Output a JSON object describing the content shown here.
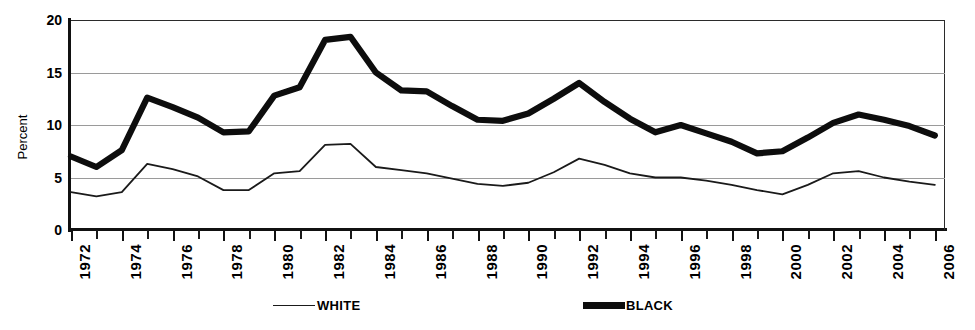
{
  "chart_data": {
    "type": "line",
    "title": "",
    "xlabel": "",
    "ylabel": "Percent",
    "ylim": [
      0,
      20
    ],
    "yticks": [
      0,
      5,
      10,
      15,
      20
    ],
    "xlim": [
      1972,
      2006
    ],
    "grid": true,
    "legend_position": "bottom",
    "x": [
      1972,
      1973,
      1974,
      1975,
      1976,
      1977,
      1978,
      1979,
      1980,
      1981,
      1982,
      1983,
      1984,
      1985,
      1986,
      1987,
      1988,
      1989,
      1990,
      1991,
      1992,
      1993,
      1994,
      1995,
      1996,
      1997,
      1998,
      1999,
      2000,
      2001,
      2002,
      2003,
      2004,
      2005,
      2006
    ],
    "xtick_labels": [
      "1972",
      "1974",
      "1976",
      "1978",
      "1980",
      "1982",
      "1984",
      "1986",
      "1988",
      "1990",
      "1992",
      "1994",
      "1996",
      "1998",
      "2000",
      "2002",
      "2004",
      "2006"
    ],
    "series": [
      {
        "name": "WHITE",
        "style": "thin",
        "color": "#1a1a1a",
        "values": [
          3.6,
          3.2,
          3.6,
          6.3,
          5.8,
          5.1,
          3.8,
          3.8,
          5.4,
          5.6,
          8.1,
          8.2,
          6.0,
          5.7,
          5.4,
          4.9,
          4.4,
          4.2,
          4.5,
          5.5,
          6.8,
          6.2,
          5.4,
          5.0,
          5.0,
          4.7,
          4.3,
          3.8,
          3.4,
          4.3,
          5.4,
          5.6,
          5.0,
          4.6,
          4.3
        ]
      },
      {
        "name": "BLACK",
        "style": "thick",
        "color": "#0d0d0d",
        "values": [
          7.0,
          6.0,
          7.6,
          12.6,
          11.7,
          10.7,
          9.3,
          9.4,
          12.8,
          13.6,
          18.1,
          18.4,
          15.0,
          13.3,
          13.2,
          11.8,
          10.5,
          10.4,
          11.1,
          12.5,
          14.0,
          12.2,
          10.6,
          9.3,
          10.0,
          9.2,
          8.4,
          7.3,
          7.5,
          8.8,
          10.2,
          11.0,
          10.5,
          9.9,
          9.0
        ]
      }
    ]
  },
  "axes": {
    "y_title": "Percent",
    "y_tick_labels": [
      "20",
      "15",
      "10",
      "5",
      "0"
    ]
  },
  "legend": {
    "entries": [
      {
        "label": "WHITE",
        "swatch": "thin-line-swatch"
      },
      {
        "label": "BLACK",
        "swatch": "thick-line-swatch"
      }
    ]
  }
}
